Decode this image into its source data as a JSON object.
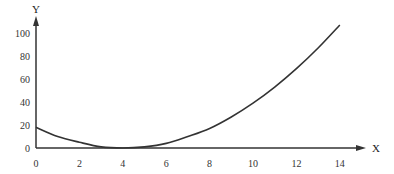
{
  "chart_data": {
    "type": "line",
    "title": "",
    "xlabel": "X",
    "ylabel": "Y",
    "xlim": [
      0,
      14
    ],
    "ylim": [
      0,
      100
    ],
    "grid": false,
    "legend": null,
    "x_ticks": [
      0,
      2,
      4,
      6,
      8,
      10,
      12,
      14
    ],
    "y_ticks": [
      0,
      20,
      40,
      60,
      80,
      100
    ],
    "series": [
      {
        "name": "curve",
        "x": [
          0,
          1,
          2,
          3,
          4,
          5,
          6,
          7,
          8,
          9,
          10,
          11,
          12,
          13,
          14
        ],
        "values": [
          18,
          10,
          5,
          1,
          0,
          1,
          4,
          10,
          17,
          27,
          39,
          53,
          69,
          87,
          107
        ]
      }
    ],
    "colors": {
      "line": "#333333",
      "axis": "#333333"
    }
  }
}
